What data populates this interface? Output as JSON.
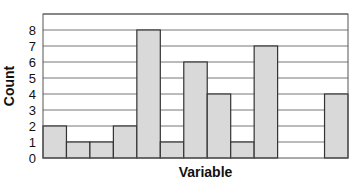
{
  "chart_data": {
    "type": "bar",
    "title": "",
    "xlabel": "Variable",
    "ylabel": "Count",
    "categories": [
      "1",
      "2",
      "3",
      "4",
      "5",
      "6",
      "7",
      "8",
      "9",
      "10",
      "11",
      "12",
      "13"
    ],
    "values": [
      2,
      1,
      1,
      2,
      8,
      1,
      6,
      4,
      1,
      7,
      0,
      0,
      4
    ],
    "yticks": [
      0,
      1,
      2,
      3,
      4,
      5,
      6,
      7,
      8
    ],
    "ylim": [
      0,
      9
    ],
    "grid": true,
    "legend": null,
    "bar_color": "#d9d9d9",
    "edge_color": "#333333"
  }
}
